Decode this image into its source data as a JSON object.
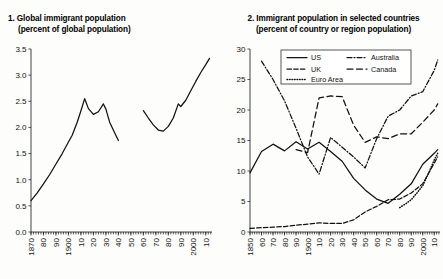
{
  "chart_data": [
    {
      "type": "line",
      "id": "global-immigrant-population",
      "title": "1. Global immigrant population",
      "subtitle": "(percent of global population)",
      "xlabel": "",
      "ylabel": "",
      "ylim": [
        0.0,
        3.5
      ],
      "xlim": [
        1870,
        2015
      ],
      "yticks": [
        "0.0",
        "0.5",
        "1.0",
        "1.5",
        "2.0",
        "2.5",
        "3.0",
        "3.5"
      ],
      "ytick_values": [
        0.0,
        0.5,
        1.0,
        1.5,
        2.0,
        2.5,
        3.0,
        3.5
      ],
      "xticks": [
        "1870",
        "80",
        "90",
        "1900",
        "10",
        "20",
        "30",
        "40",
        "50",
        "60",
        "70",
        "80",
        "90",
        "2000",
        "10"
      ],
      "xtick_values": [
        1870,
        1880,
        1890,
        1900,
        1910,
        1920,
        1930,
        1940,
        1950,
        1960,
        1970,
        1980,
        1990,
        2000,
        2010
      ],
      "minor_tick_step": 2,
      "grid": false,
      "legend": "none",
      "series": [
        {
          "name": "World",
          "style": "solid",
          "segments": [
            {
              "x": [
                1870,
                1875,
                1880,
                1885,
                1890,
                1895,
                1900,
                1903,
                1907,
                1910,
                1913,
                1916,
                1920,
                1924,
                1928,
                1930,
                1933,
                1937,
                1940
              ],
              "y": [
                0.6,
                0.75,
                0.92,
                1.1,
                1.3,
                1.5,
                1.72,
                1.85,
                2.1,
                2.32,
                2.55,
                2.36,
                2.25,
                2.3,
                2.45,
                2.35,
                2.1,
                1.9,
                1.75
              ]
            },
            {
              "x": [
                1960,
                1964,
                1968,
                1972,
                1976,
                1980,
                1984,
                1988,
                1990,
                1994,
                1998,
                2002,
                2006,
                2010,
                2013
              ],
              "y": [
                2.32,
                2.18,
                2.05,
                1.95,
                1.93,
                2.02,
                2.18,
                2.45,
                2.4,
                2.52,
                2.7,
                2.88,
                3.05,
                3.2,
                3.32
              ]
            }
          ]
        }
      ],
      "notes": "Data gap between 1940 and 1960."
    },
    {
      "type": "line",
      "id": "immigrant-population-selected-countries",
      "title": "2. Immigrant population in selected countries",
      "subtitle": "(percent of country or region population)",
      "xlabel": "",
      "ylabel": "",
      "ylim": [
        0,
        30
      ],
      "xlim": [
        1850,
        2015
      ],
      "yticks": [
        "0",
        "5",
        "10",
        "15",
        "20",
        "25",
        "30"
      ],
      "ytick_values": [
        0,
        5,
        10,
        15,
        20,
        25,
        30
      ],
      "xticks": [
        "1850",
        "60",
        "70",
        "80",
        "90",
        "1900",
        "10",
        "20",
        "30",
        "40",
        "50",
        "60",
        "70",
        "80",
        "90",
        "2000",
        "10"
      ],
      "xtick_values": [
        1850,
        1860,
        1870,
        1880,
        1890,
        1900,
        1910,
        1920,
        1930,
        1940,
        1950,
        1960,
        1970,
        1980,
        1990,
        2000,
        2010
      ],
      "minor_tick_step": 2,
      "grid": false,
      "legend": "top-right",
      "series": [
        {
          "name": "US",
          "style": "solid",
          "x": [
            1850,
            1860,
            1870,
            1880,
            1890,
            1900,
            1910,
            1920,
            1930,
            1940,
            1950,
            1960,
            1970,
            1980,
            1990,
            2000,
            2010,
            2013
          ],
          "y": [
            9.7,
            13.2,
            14.4,
            13.3,
            14.8,
            13.6,
            14.7,
            13.2,
            11.6,
            8.8,
            6.9,
            5.4,
            4.7,
            6.2,
            7.9,
            11.1,
            12.9,
            13.5
          ]
        },
        {
          "name": "UK",
          "style": "dashed",
          "x": [
            1850,
            1860,
            1870,
            1880,
            1890,
            1900,
            1910,
            1920,
            1930,
            1940,
            1950,
            1960,
            1970,
            1980,
            1990,
            2000,
            2010,
            2013
          ],
          "y": [
            0.6,
            0.7,
            0.8,
            0.9,
            1.1,
            1.3,
            1.5,
            1.4,
            1.4,
            2.0,
            3.3,
            4.2,
            5.3,
            5.4,
            6.4,
            7.9,
            11.3,
            12.3
          ]
        },
        {
          "name": "Australia",
          "style": "dash-dot",
          "x": [
            1860,
            1870,
            1880,
            1890,
            1900,
            1910,
            1920,
            1930,
            1940,
            1950,
            1960,
            1970,
            1980,
            1990,
            2000,
            2010,
            2013
          ],
          "y": [
            28.0,
            25.0,
            21.5,
            17.0,
            12.3,
            9.5,
            15.5,
            13.9,
            12.3,
            10.5,
            15.3,
            19.0,
            20.0,
            22.3,
            23.0,
            26.5,
            28.2
          ]
        },
        {
          "name": "Canada",
          "style": "long-dash",
          "x": [
            1890,
            1900,
            1910,
            1920,
            1930,
            1940,
            1950,
            1960,
            1970,
            1980,
            1990,
            2000,
            2010,
            2013
          ],
          "y": [
            13.5,
            13.0,
            22.0,
            22.3,
            22.2,
            17.5,
            14.7,
            15.6,
            15.3,
            16.1,
            16.1,
            18.0,
            20.0,
            21.0
          ]
        },
        {
          "name": "Euro Area",
          "style": "dotted",
          "x": [
            1980,
            1985,
            1990,
            1995,
            2000,
            2005,
            2010,
            2013
          ],
          "y": [
            4.0,
            4.6,
            5.3,
            6.4,
            7.6,
            9.6,
            11.8,
            12.9
          ]
        }
      ],
      "legend_entries": [
        {
          "label": "US",
          "style": "solid"
        },
        {
          "label": "Australia",
          "style": "dash-dot"
        },
        {
          "label": "UK",
          "style": "dashed"
        },
        {
          "label": "Canada",
          "style": "long-dash"
        },
        {
          "label": "Euro Area",
          "style": "dotted"
        }
      ]
    }
  ],
  "panel1": {
    "title_line1": "1. Global immigrant population",
    "title_line2": "(percent of global population)"
  },
  "panel2": {
    "title_line1": "2. Immigrant population in selected countries",
    "title_line2": "(percent of country or region population)"
  }
}
